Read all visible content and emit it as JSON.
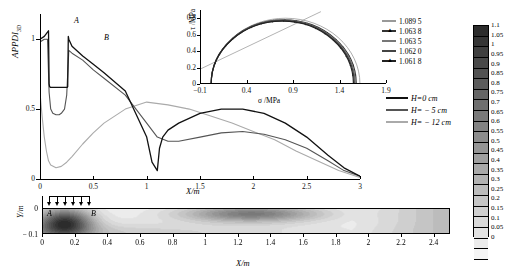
{
  "figure": {
    "point_labels": [
      {
        "name": "A",
        "text": "A"
      },
      {
        "name": "B",
        "text": "B"
      }
    ]
  },
  "main_plot": {
    "ylabel_main": "APPDI",
    "ylabel_sub": "3D",
    "xlabel": "X/m",
    "xticks": [
      "0",
      "0.5",
      "1",
      "1.5",
      "2",
      "2.5",
      "3"
    ],
    "xtick_values": [
      0,
      0.5,
      1,
      1.5,
      2,
      2.5,
      3
    ],
    "yticks": [
      "0",
      "0.5",
      "1"
    ],
    "ytick_values": [
      0,
      0.5,
      1
    ],
    "xlim": [
      0,
      3
    ],
    "ylim": [
      0,
      1.18
    ],
    "label_a": "A",
    "label_b": "B"
  },
  "main_legend": {
    "items": [
      {
        "label": "H=0 cm",
        "color": "#111111",
        "width": 1.6
      },
      {
        "label": "H= − 5 cm",
        "color": "#555555",
        "width": 1.4
      },
      {
        "label": "H= − 12 cm",
        "color": "#aaaaaa",
        "width": 1.2
      }
    ]
  },
  "inset": {
    "xlabel": "σ /MPa",
    "ylabel": "τ /MPa",
    "xticks": [
      "−0.1",
      "0.4",
      "0.9",
      "1.4",
      "1.9"
    ],
    "xtick_values": [
      -0.1,
      0.4,
      0.9,
      1.4,
      1.9
    ],
    "yticks": [
      "0",
      "0.2",
      "0.4",
      "0.6",
      "0.8"
    ],
    "ytick_values": [
      0,
      0.2,
      0.4,
      0.6,
      0.8
    ],
    "xlim": [
      -0.1,
      1.9
    ],
    "ylim": [
      0,
      0.9
    ],
    "legend": [
      {
        "label": "1.089 5",
        "color": "#999999",
        "marker": "none"
      },
      {
        "label": "1.063 8",
        "color": "#333333",
        "marker": "tri"
      },
      {
        "label": "1.063 5",
        "color": "#777777",
        "marker": "none"
      },
      {
        "label": "1.062 0",
        "color": "#444444",
        "marker": "none"
      },
      {
        "label": "1.061 8",
        "color": "#222222",
        "marker": "tri"
      }
    ]
  },
  "contour_panel": {
    "ylabel": "Y/m",
    "xlabel": "X/m",
    "yticks": [
      "0",
      "− 0.1"
    ],
    "ytick_values": [
      0,
      -0.1
    ],
    "xticks": [
      "0",
      "0.2",
      "0.4",
      "0.6",
      "0.8",
      "1",
      "1.2",
      "1.4",
      "1.6",
      "1.8",
      "2",
      "2.2",
      "2.4"
    ],
    "xtick_values": [
      0,
      0.2,
      0.4,
      0.6,
      0.8,
      1,
      1.2,
      1.4,
      1.6,
      1.8,
      2,
      2.2,
      2.4
    ],
    "xlim": [
      0,
      2.5
    ],
    "label_a": "A",
    "label_b": "B",
    "load_arrows": 6
  },
  "colorbar": {
    "labels": [
      "1.1",
      "1.05",
      "1",
      "0.95",
      "0.9",
      "0.85",
      "0.8",
      "0.75",
      "0.7",
      "0.65",
      "0.6",
      "0.55",
      "0.5",
      "0.45",
      "0.4",
      "0.35",
      "0.3",
      "0.25",
      "0.2",
      "0.15",
      "0.1",
      "0.05",
      "0"
    ],
    "values": [
      1.1,
      1.05,
      1,
      0.95,
      0.9,
      0.85,
      0.8,
      0.75,
      0.7,
      0.65,
      0.6,
      0.55,
      0.5,
      0.45,
      0.4,
      0.35,
      0.3,
      0.25,
      0.2,
      0.15,
      0.1,
      0.05,
      0
    ],
    "max": 1.1,
    "min": 0
  },
  "chart_data": {
    "type": "line",
    "xlabel": "X/m",
    "ylabel": "APPDI_3D",
    "xlim": [
      0,
      3
    ],
    "ylim": [
      0,
      1.18
    ],
    "grid": false,
    "legend_position": "right",
    "annotations": [
      {
        "text": "A",
        "x": 0.08,
        "y": 1.14
      },
      {
        "text": "B",
        "x": 0.27,
        "y": 1.1
      }
    ],
    "series": [
      {
        "name": "H=0 cm",
        "color": "#111111",
        "x": [
          0,
          0.04,
          0.07,
          0.08,
          0.085,
          0.09,
          0.1,
          0.12,
          0.15,
          0.18,
          0.2,
          0.23,
          0.255,
          0.26,
          0.265,
          0.27,
          0.3,
          0.4,
          0.5,
          0.6,
          0.8,
          1.0,
          1.05,
          1.1,
          1.12,
          1.15,
          1.2,
          1.3,
          1.5,
          1.7,
          1.9,
          2.1,
          2.3,
          2.5,
          2.7,
          2.85,
          3.0
        ],
        "y": [
          1.0,
          1.02,
          1.05,
          1.06,
          0.68,
          0.66,
          0.655,
          0.655,
          0.655,
          0.655,
          0.655,
          0.655,
          0.655,
          0.66,
          1.02,
          1.0,
          0.95,
          0.88,
          0.82,
          0.76,
          0.63,
          0.3,
          0.12,
          0.06,
          0.22,
          0.3,
          0.35,
          0.4,
          0.47,
          0.5,
          0.5,
          0.47,
          0.4,
          0.3,
          0.17,
          0.08,
          0.02
        ]
      },
      {
        "name": "H= − 5 cm",
        "color": "#555555",
        "x": [
          0,
          0.04,
          0.07,
          0.085,
          0.1,
          0.12,
          0.15,
          0.18,
          0.2,
          0.23,
          0.25,
          0.26,
          0.27,
          0.3,
          0.4,
          0.5,
          0.6,
          0.8,
          1.0,
          1.1,
          1.2,
          1.3,
          1.5,
          1.7,
          1.9,
          2.1,
          2.3,
          2.5,
          2.7,
          2.85,
          3.0
        ],
        "y": [
          0.98,
          1.0,
          1.0,
          0.62,
          0.5,
          0.47,
          0.46,
          0.46,
          0.47,
          0.5,
          0.6,
          0.75,
          0.92,
          0.9,
          0.85,
          0.78,
          0.72,
          0.6,
          0.4,
          0.3,
          0.27,
          0.27,
          0.3,
          0.33,
          0.34,
          0.32,
          0.28,
          0.22,
          0.13,
          0.06,
          0.02
        ]
      },
      {
        "name": "H= − 12 cm",
        "color": "#aaaaaa",
        "x": [
          0,
          0.02,
          0.04,
          0.06,
          0.08,
          0.1,
          0.15,
          0.2,
          0.25,
          0.3,
          0.4,
          0.5,
          0.6,
          0.8,
          1.0,
          1.2,
          1.4,
          1.6,
          1.8,
          2.0,
          2.2,
          2.4,
          2.6,
          2.8,
          3.0
        ],
        "y": [
          0.62,
          0.45,
          0.3,
          0.2,
          0.13,
          0.1,
          0.08,
          0.09,
          0.12,
          0.16,
          0.25,
          0.33,
          0.4,
          0.5,
          0.55,
          0.53,
          0.5,
          0.45,
          0.4,
          0.34,
          0.28,
          0.2,
          0.13,
          0.06,
          0.01
        ]
      }
    ],
    "inset_chart": {
      "type": "line",
      "title": "Mohr circles",
      "xlabel": "σ /MPa",
      "ylabel": "τ /MPa",
      "xlim": [
        -0.1,
        1.9
      ],
      "ylim": [
        0,
        0.9
      ],
      "circles": [
        {
          "name": "1.089 5",
          "center": 0.82,
          "radius": 0.8,
          "color": "#999999"
        },
        {
          "name": "1.063 8",
          "center": 0.8,
          "radius": 0.78,
          "color": "#333333"
        },
        {
          "name": "1.063 5",
          "center": 0.795,
          "radius": 0.775,
          "color": "#777777"
        },
        {
          "name": "1.062 0",
          "center": 0.79,
          "radius": 0.77,
          "color": "#444444"
        },
        {
          "name": "1.061 8",
          "center": 0.785,
          "radius": 0.765,
          "color": "#222222"
        }
      ],
      "envelope_line": {
        "from": [
          -0.1,
          0.18
        ],
        "to": [
          1.2,
          0.88
        ],
        "color": "#aaaaaa"
      }
    }
  }
}
